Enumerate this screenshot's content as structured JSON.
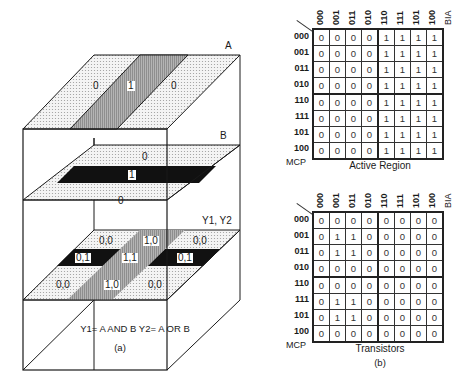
{
  "panel_a": {
    "planes": {
      "A": {
        "label": "A",
        "regions": [
          "0",
          "1",
          "0"
        ]
      },
      "B": {
        "label": "B",
        "regions": [
          "0",
          "1",
          "0"
        ]
      },
      "Y": {
        "label": "Y1, Y2",
        "regions": [
          "0,0",
          "1,0",
          "0,0",
          "0,1",
          "1,1",
          "0,1",
          "0,0",
          "1,0",
          "0,0"
        ]
      }
    },
    "equation": "Y1= A AND B  Y2= A OR B",
    "caption": "(a)"
  },
  "panel_b": {
    "columns": [
      "000",
      "001",
      "011",
      "010",
      "110",
      "111",
      "101",
      "100"
    ],
    "col_axis": "BIA",
    "rows": [
      "000",
      "001",
      "011",
      "010",
      "110",
      "111",
      "101",
      "100"
    ],
    "row_axis": "MCP",
    "active_region": {
      "title": "Active Region",
      "cells": [
        [
          "0",
          "0",
          "0",
          "0",
          "1",
          "1",
          "1",
          "1"
        ],
        [
          "0",
          "0",
          "0",
          "0",
          "1",
          "1",
          "1",
          "1"
        ],
        [
          "0",
          "0",
          "0",
          "0",
          "1",
          "1",
          "1",
          "1"
        ],
        [
          "0",
          "0",
          "0",
          "0",
          "1",
          "1",
          "1",
          "1"
        ],
        [
          "0",
          "0",
          "0",
          "0",
          "1",
          "1",
          "1",
          "1"
        ],
        [
          "0",
          "0",
          "0",
          "0",
          "1",
          "1",
          "1",
          "1"
        ],
        [
          "0",
          "0",
          "0",
          "0",
          "1",
          "1",
          "1",
          "1"
        ],
        [
          "0",
          "0",
          "0",
          "0",
          "1",
          "1",
          "1",
          "1"
        ]
      ]
    },
    "transistors": {
      "title": "Transistors",
      "cells": [
        [
          "0",
          "0",
          "0",
          "0",
          "0",
          "0",
          "0",
          "0"
        ],
        [
          "0",
          "1",
          "1",
          "0",
          "0",
          "0",
          "0",
          "0"
        ],
        [
          "0",
          "1",
          "1",
          "0",
          "0",
          "0",
          "0",
          "0"
        ],
        [
          "0",
          "0",
          "0",
          "0",
          "0",
          "0",
          "0",
          "0"
        ],
        [
          "0",
          "0",
          "0",
          "0",
          "0",
          "0",
          "0",
          "0"
        ],
        [
          "0",
          "1",
          "1",
          "0",
          "0",
          "0",
          "0",
          "0"
        ],
        [
          "0",
          "1",
          "1",
          "0",
          "0",
          "0",
          "0",
          "0"
        ],
        [
          "0",
          "0",
          "0",
          "0",
          "0",
          "0",
          "0",
          "0"
        ]
      ]
    },
    "caption": "(b)"
  },
  "colors": {
    "dots": "#d8d8d8",
    "stripe": "#a8a8a8",
    "black": "#111111",
    "line": "#1a1a1a"
  }
}
